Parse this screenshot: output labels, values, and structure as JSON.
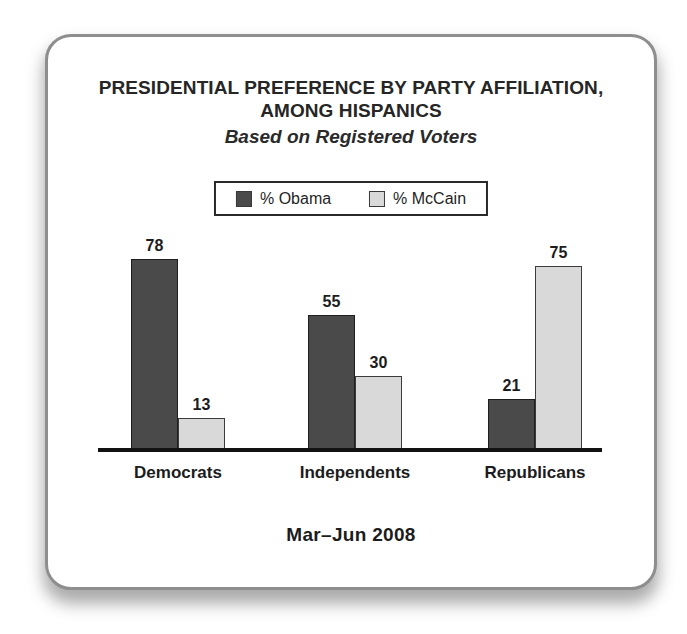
{
  "card": {
    "title_line1": "PRESIDENTIAL PREFERENCE BY PARTY AFFILIATION,",
    "title_line2": "AMONG HISPANICS",
    "subtitle": "Based on Registered Voters",
    "period_label": "Mar–Jun 2008"
  },
  "legend": {
    "items": [
      {
        "label": "% Obama"
      },
      {
        "label": "% McCain"
      }
    ]
  },
  "chart_data": {
    "type": "bar",
    "title": "PRESIDENTIAL PREFERENCE BY PARTY AFFILIATION, AMONG HISPANICS",
    "subtitle": "Based on Registered Voters",
    "categories": [
      "Democrats",
      "Independents",
      "Republicans"
    ],
    "series": [
      {
        "name": "% Obama",
        "color": "#4a4a4a",
        "values": [
          78,
          55,
          21
        ]
      },
      {
        "name": "% McCain",
        "color": "#d9d9d9",
        "values": [
          13,
          30,
          75
        ]
      }
    ],
    "xlabel": "Mar–Jun 2008",
    "ylabel": "",
    "ylim": [
      0,
      85
    ],
    "grid": false,
    "legend_position": "top-center",
    "value_labels": true
  },
  "colors": {
    "obama_bar": "#4a4a4a",
    "mccain_bar": "#d9d9d9",
    "axis_line": "#121212",
    "card_border": "#8e8e8e",
    "text": "#1f1f1f"
  }
}
